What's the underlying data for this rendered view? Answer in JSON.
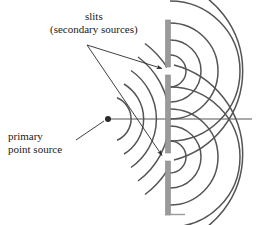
{
  "figure": {
    "kind": "physics-diagram",
    "background_color": "#ffffff",
    "stroke_color": "#4a4a4a",
    "barrier_color": "#9a9a9a",
    "text_color": "#1a1a1a"
  },
  "labels": {
    "slits": {
      "line1": "slits",
      "line2": "(secondary sources)"
    },
    "primary_source": {
      "line1": "primary",
      "line2": "point source"
    }
  },
  "barrier": {
    "name": "opaque screen with two slits",
    "x": 168,
    "top_y": 20,
    "bottom_y": 215,
    "thickness": 5,
    "color": "#9a9a9a",
    "slits": [
      {
        "id": "upper-slit",
        "center_y": 71,
        "gap": 8
      },
      {
        "id": "lower-slit",
        "center_y": 157,
        "gap": 8
      }
    ]
  },
  "primary_source": {
    "name": "primary point source",
    "x": 108,
    "y": 119,
    "dot_radius": 3,
    "incident_wavefront_radii": [
      22,
      40,
      58,
      76,
      94
    ],
    "wavefront_angular_span_deg": 150
  },
  "secondary_sources": [
    {
      "id": "upper-slit-source",
      "x": 170,
      "y": 71,
      "wavefront_radii": [
        16,
        31,
        48,
        70,
        92
      ]
    },
    {
      "id": "lower-slit-source",
      "x": 170,
      "y": 157,
      "wavefront_radii": [
        16,
        31,
        48,
        70,
        92
      ]
    }
  ],
  "axis_line": {
    "name": "optical axis",
    "from_x": 108,
    "from_y": 119,
    "to_x": 252,
    "to_y": 119
  },
  "leader_lines": [
    {
      "id": "slits-leader-upper",
      "from_x": 87,
      "from_y": 45,
      "to_x": 164,
      "to_y": 69,
      "arrowhead": true
    },
    {
      "id": "slits-leader-lower",
      "from_x": 87,
      "from_y": 45,
      "to_x": 164,
      "to_y": 156,
      "arrowhead": true
    },
    {
      "id": "primary-source-leader",
      "from_x": 77,
      "from_y": 139,
      "to_x": 104,
      "to_y": 121,
      "arrowhead": false
    }
  ]
}
